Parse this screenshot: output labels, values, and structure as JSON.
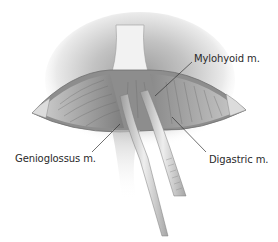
{
  "figure": {
    "labels": [
      {
        "id": "mylohyoid",
        "text": "Mylohyoid m."
      },
      {
        "id": "genioglossus",
        "text": "Genioglossus m."
      },
      {
        "id": "digastric",
        "text": "Digastric m."
      }
    ]
  },
  "colors": {
    "background": "#ffffff",
    "skin_shadow": "#9a9a9a",
    "tissue_dark": "#5a5a5a",
    "tissue_mid": "#a8a8a8",
    "instrument": "#d4d4d4",
    "leader_line": "#333333",
    "label_text": "#2a2a2a"
  }
}
